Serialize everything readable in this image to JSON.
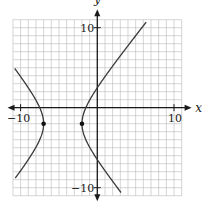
{
  "chart_data": {
    "type": "line",
    "title": "",
    "xlabel": "x",
    "ylabel": "y",
    "xlim": [
      -11,
      11
    ],
    "ylim": [
      -11,
      11
    ],
    "grid": true,
    "grid_step": 1,
    "tick_labels": {
      "x": [
        {
          "value": -10,
          "label": "−10"
        },
        {
          "value": 10,
          "label": "10"
        }
      ],
      "y": [
        {
          "value": 10,
          "label": "10"
        },
        {
          "value": -10,
          "label": "−10"
        }
      ]
    },
    "series": [
      {
        "name": "hyperbola",
        "equation": "(x+4.5)^2/2.5^2 - (y+2)^2/3^2 = 1",
        "center": [
          -4.5,
          -2
        ],
        "a": 2.5,
        "b": 3,
        "branches": [
          {
            "name": "left-branch",
            "y_range": [
              -8.8,
              4.9
            ]
          },
          {
            "name": "right-branch",
            "y_range": [
              -10.6,
              10.7
            ]
          }
        ]
      }
    ],
    "points": [
      {
        "name": "left-vertex",
        "x": -7,
        "y": -2
      },
      {
        "name": "right-vertex",
        "x": -2,
        "y": -2
      }
    ]
  },
  "labels": {
    "x_axis": "x",
    "y_axis": "y",
    "x_neg10": "−10",
    "x_pos10": "10",
    "y_pos10": "10",
    "y_neg10": "−10"
  }
}
